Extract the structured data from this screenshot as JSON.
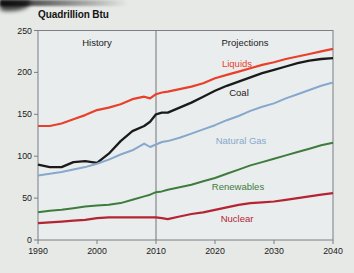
{
  "title": "Quadrillion Btu",
  "annotations": {
    "history_label": "History",
    "projections_label": "Projections"
  },
  "colors": {
    "frame": "#7a7f84",
    "divider": "#6f7478",
    "tick_text": "#1a1a1a",
    "plot_background": "#eaedee",
    "page_background": "#e6e9e6"
  },
  "chart_data": {
    "type": "line",
    "title": "Quadrillion Btu",
    "xlabel": "",
    "ylabel": "Quadrillion Btu",
    "xlim": [
      1990,
      2040
    ],
    "ylim": [
      0,
      250
    ],
    "x_ticks": [
      "1990",
      "2000",
      "2010",
      "2020",
      "2030",
      "2040"
    ],
    "x_tick_values": [
      1990,
      2000,
      2010,
      2020,
      2030,
      2040
    ],
    "y_ticks": [
      "0",
      "50",
      "100",
      "150",
      "200",
      "250"
    ],
    "y_tick_values": [
      0,
      50,
      100,
      150,
      200,
      250
    ],
    "grid": false,
    "legend_position": "inline-labels",
    "divider_year": 2010,
    "regions": [
      {
        "label": "History",
        "from": 1990,
        "to": 2010
      },
      {
        "label": "Projections",
        "from": 2010,
        "to": 2040
      }
    ],
    "x": [
      1990,
      1992,
      1994,
      1996,
      1998,
      2000,
      2002,
      2004,
      2006,
      2008,
      2009,
      2010,
      2011,
      2012,
      2014,
      2016,
      2018,
      2020,
      2022,
      2024,
      2026,
      2028,
      2030,
      2032,
      2034,
      2036,
      2038,
      2040
    ],
    "series": [
      {
        "name": "Liquids",
        "color": "#e8402a",
        "values": [
          136,
          136,
          139,
          144,
          149,
          155,
          158,
          162,
          168,
          171,
          169,
          174,
          176,
          177,
          180,
          183,
          187,
          193,
          197,
          201,
          205,
          209,
          212,
          216,
          219,
          222,
          225,
          228
        ]
      },
      {
        "name": "Coal",
        "color": "#1a1a1a",
        "values": [
          90,
          87,
          87,
          93,
          94,
          92,
          103,
          118,
          130,
          136,
          141,
          150,
          152,
          152,
          158,
          164,
          171,
          178,
          184,
          189,
          194,
          199,
          203,
          207,
          211,
          214,
          216,
          217
        ]
      },
      {
        "name": "Natural Gas",
        "color": "#85a8cc",
        "values": [
          77,
          79,
          81,
          84,
          87,
          91,
          96,
          102,
          107,
          115,
          111,
          114,
          117,
          118,
          122,
          127,
          132,
          137,
          143,
          148,
          154,
          159,
          163,
          169,
          174,
          179,
          184,
          188
        ]
      },
      {
        "name": "Renewables",
        "color": "#3e7c3c",
        "values": [
          33,
          35,
          36,
          38,
          40,
          41,
          42,
          44,
          48,
          52,
          54,
          57,
          58,
          60,
          63,
          66,
          70,
          74,
          79,
          84,
          89,
          93,
          97,
          101,
          105,
          109,
          113,
          116
        ]
      },
      {
        "name": "Nuclear",
        "color": "#b42432",
        "values": [
          20,
          21,
          22,
          23,
          24,
          26,
          27,
          27,
          27,
          27,
          27,
          27,
          26,
          25,
          28,
          31,
          33,
          36,
          39,
          42,
          44,
          45,
          46,
          48,
          50,
          52,
          54,
          56
        ]
      }
    ]
  }
}
